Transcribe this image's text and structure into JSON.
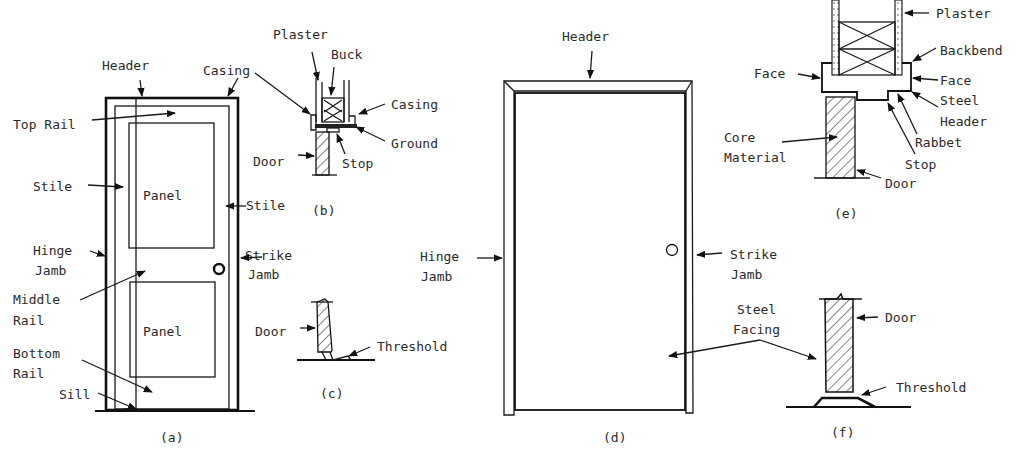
{
  "figure": {
    "panels": [
      {
        "id": "a",
        "caption": "(a)",
        "title": "Wood panel door elevation",
        "labels": {
          "header": "Header",
          "casing": "Casing",
          "top_rail": "Top Rail",
          "stile_left": "Stile",
          "stile_right": "Stile",
          "panel_top": "Panel",
          "panel_bottom": "Panel",
          "hinge_jamb_1": "Hinge",
          "hinge_jamb_2": "Jamb",
          "middle_rail_1": "Middle",
          "middle_rail_2": "Rail",
          "bottom_rail_1": "Bottom",
          "bottom_rail_2": "Rail",
          "sill": "Sill",
          "strike_jamb_1": "Strike",
          "strike_jamb_2": "Jamb"
        }
      },
      {
        "id": "b",
        "caption": "(b)",
        "title": "Wood door head section",
        "labels": {
          "plaster": "Plaster",
          "buck": "Buck",
          "casing": "Casing",
          "ground": "Ground",
          "door": "Door",
          "stop": "Stop"
        }
      },
      {
        "id": "c",
        "caption": "(c)",
        "title": "Wood door sill section",
        "labels": {
          "door": "Door",
          "threshold": "Threshold"
        }
      },
      {
        "id": "d",
        "caption": "(d)",
        "title": "Steel door elevation",
        "labels": {
          "header": "Header",
          "hinge_jamb_1": "Hinge",
          "hinge_jamb_2": "Jamb",
          "strike_jamb_1": "Strike",
          "strike_jamb_2": "Jamb",
          "steel_facing_1": "Steel",
          "steel_facing_2": "Facing"
        }
      },
      {
        "id": "e",
        "caption": "(e)",
        "title": "Steel door head section",
        "labels": {
          "plaster": "Plaster",
          "backbend": "Backbend",
          "face_left": "Face",
          "face_right": "Face",
          "steel_header_1": "Steel",
          "steel_header_2": "Header",
          "rabbet": "Rabbet",
          "stop": "Stop",
          "core_material_1": "Core",
          "core_material_2": "Material",
          "door": "Door"
        }
      },
      {
        "id": "f",
        "caption": "(f)",
        "title": "Steel door sill section",
        "labels": {
          "door": "Door",
          "threshold": "Threshold"
        }
      }
    ]
  },
  "colors": {
    "ink": "#1a1a1a",
    "background": "#ffffff"
  }
}
